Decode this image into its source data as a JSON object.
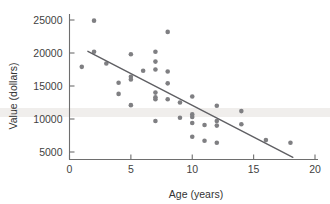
{
  "chart_data": {
    "type": "scatter",
    "title": "",
    "xlabel": "Age (years)",
    "ylabel": "Value (dollars)",
    "xlim": [
      0,
      20
    ],
    "ylim": [
      3300,
      26600
    ],
    "xticks": [
      0,
      5,
      10,
      15,
      20
    ],
    "yticks": [
      5000,
      10000,
      15000,
      20000,
      25000
    ],
    "xtick_labels": [
      "0",
      "5",
      "10",
      "15",
      "20"
    ],
    "ytick_labels": [
      "5000",
      "10000",
      "15000",
      "20000",
      "25000"
    ],
    "grid": false,
    "legend": null,
    "point_color": "#7f7f82",
    "line_color": "#5f5f63",
    "axis_color": "#6e6e6e",
    "series": [
      {
        "name": "Used car value by age",
        "points": [
          {
            "x": 1,
            "y": 17900
          },
          {
            "x": 2,
            "y": 24900
          },
          {
            "x": 2,
            "y": 20200
          },
          {
            "x": 3,
            "y": 18400
          },
          {
            "x": 4,
            "y": 15500
          },
          {
            "x": 4,
            "y": 13800
          },
          {
            "x": 5,
            "y": 19800
          },
          {
            "x": 5,
            "y": 16400
          },
          {
            "x": 5,
            "y": 16000
          },
          {
            "x": 5,
            "y": 12100
          },
          {
            "x": 6,
            "y": 17300
          },
          {
            "x": 7,
            "y": 20200
          },
          {
            "x": 7,
            "y": 18700
          },
          {
            "x": 7,
            "y": 17500
          },
          {
            "x": 7,
            "y": 14000
          },
          {
            "x": 7,
            "y": 13300
          },
          {
            "x": 7,
            "y": 13000
          },
          {
            "x": 7,
            "y": 9700
          },
          {
            "x": 8,
            "y": 23200
          },
          {
            "x": 8,
            "y": 17200
          },
          {
            "x": 8,
            "y": 15400
          },
          {
            "x": 8,
            "y": 13000
          },
          {
            "x": 9,
            "y": 12500
          },
          {
            "x": 9,
            "y": 10200
          },
          {
            "x": 10,
            "y": 13400
          },
          {
            "x": 10,
            "y": 10700
          },
          {
            "x": 10,
            "y": 10300
          },
          {
            "x": 10,
            "y": 9400
          },
          {
            "x": 10,
            "y": 7300
          },
          {
            "x": 11,
            "y": 9100
          },
          {
            "x": 11,
            "y": 6700
          },
          {
            "x": 12,
            "y": 12000
          },
          {
            "x": 12,
            "y": 9700
          },
          {
            "x": 12,
            "y": 9000
          },
          {
            "x": 12,
            "y": 6400
          },
          {
            "x": 14,
            "y": 11200
          },
          {
            "x": 14,
            "y": 9200
          },
          {
            "x": 16,
            "y": 6800
          },
          {
            "x": 18,
            "y": 6400
          }
        ]
      }
    ],
    "trend_line": {
      "type": "linear-fit",
      "x_start": 1.5,
      "y_start": 20250,
      "x_end": 18.2,
      "y_end": 4200
    }
  }
}
